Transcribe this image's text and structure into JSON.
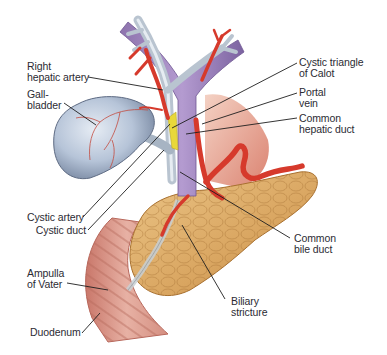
{
  "figure": {
    "colors": {
      "background": "#ffffff",
      "gallbladder": "#b9c6d8",
      "bile_duct": "#aab8c8",
      "portal_vein": "#9a82b8",
      "artery": "#d63a2c",
      "pancreas": "#d9a764",
      "duodenum": "#d99a8e",
      "calot_triangle": "#e8d83a",
      "muscle": "#d86a50",
      "leader_line": "#1e1e1e",
      "label_text": "#2b2b33"
    }
  },
  "labels": {
    "right_hepatic_artery": "Right\nhepatic artery",
    "gallbladder": "Gall-\nbladder",
    "cystic_triangle": "Cystic triangle\nof Calot",
    "portal_vein": "Portal\nvein",
    "common_hepatic_duct": "Common\nhepatic duct",
    "cystic_artery": "Cystic artery",
    "cystic_duct": "Cystic duct",
    "common_bile_duct": "Common\nbile duct",
    "ampulla_of_vater": "Ampulla\nof Vater",
    "biliary_stricture": "Biliary\nstricture",
    "duodenum": "Duodenum"
  }
}
